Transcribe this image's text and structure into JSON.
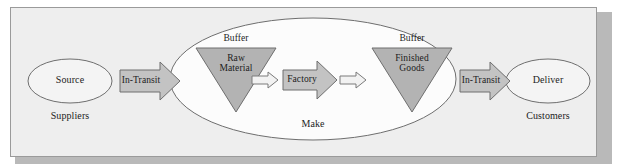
{
  "diagram": {
    "frame": {
      "background_color": "#eeeeee",
      "border_color": "#9a9a9a",
      "shadow_color": "#b9b9b9"
    },
    "palette": {
      "fill_gray": "#b3b3b3",
      "fill_light": "#d4d4d4",
      "fill_white": "#fcfcfc",
      "stroke": "#6e6e6e",
      "text": "#1c1c1c"
    },
    "nodes": {
      "source": {
        "label": "Source",
        "caption": "Suppliers",
        "shape": "ellipse"
      },
      "in_transit_left": {
        "label": "In-Transit",
        "shape": "block-arrow-right"
      },
      "make": {
        "label": "Make",
        "shape": "ellipse"
      },
      "raw_material": {
        "label_line1": "Raw",
        "label_line2": "Material",
        "caption": "Buffer",
        "shape": "triangle-down"
      },
      "arrow_1": {
        "shape": "small-arrow-right"
      },
      "factory": {
        "label": "Factory",
        "shape": "block-arrow-right"
      },
      "arrow_2": {
        "shape": "small-arrow-right"
      },
      "finished_goods": {
        "label_line1": "Finished",
        "label_line2": "Goods",
        "caption": "Buffer",
        "shape": "triangle-down"
      },
      "in_transit_right": {
        "label": "In-Transit",
        "shape": "block-arrow-right"
      },
      "deliver": {
        "label": "Deliver",
        "caption": "Customers",
        "shape": "ellipse"
      }
    }
  }
}
